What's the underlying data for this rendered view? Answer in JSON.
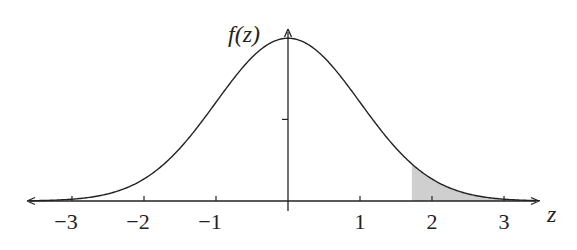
{
  "chart_data": {
    "type": "area",
    "title": "",
    "function": "standard normal density f(z)",
    "xlabel": "z",
    "ylabel": "f(z)",
    "xlim": [
      -3.6,
      3.5
    ],
    "ylim": [
      0,
      0.42
    ],
    "x_ticks": [
      -3,
      -2,
      -1,
      1,
      2,
      3
    ],
    "x_tick_labels": [
      "−3",
      "−2",
      "−1",
      "1",
      "2",
      "3"
    ],
    "y_ticks": [
      0.2
    ],
    "y_tick_labels": [
      ""
    ],
    "peak": {
      "z": 0,
      "f": 0.399
    },
    "shaded_region": {
      "from": 1.72,
      "to": 3.5,
      "color": "#d0d0d0"
    },
    "grid": false,
    "legend": null
  },
  "labels": {
    "y_axis": "f(z)",
    "x_axis": "z"
  },
  "colors": {
    "line": "#222222",
    "shade": "#cfcfcf"
  }
}
